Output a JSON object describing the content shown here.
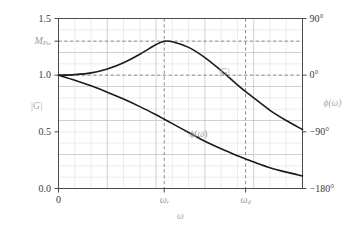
{
  "chart_data": {
    "type": "line",
    "title": "",
    "xlabel": "ω",
    "ylabel_left": "|G|",
    "ylabel_right": "ϕ(ω)",
    "grid": true,
    "legend": "inline-annotations",
    "xlim": [
      0,
      15
    ],
    "ylim_left": [
      0.0,
      1.5
    ],
    "ylim_right": [
      -180,
      90
    ],
    "x_ticks": [
      {
        "value": 0,
        "label": "0"
      },
      {
        "value": 6.5,
        "label": "ωr"
      },
      {
        "value": 11.5,
        "label": "ωd"
      }
    ],
    "y_ticks_left": [
      {
        "value": 1.5,
        "label": "1.5"
      },
      {
        "value": 1.3,
        "label": "MPw"
      },
      {
        "value": 1.0,
        "label": "1.0"
      },
      {
        "value": 0.5,
        "label": "0.5"
      },
      {
        "value": 0.0,
        "label": "0.0"
      }
    ],
    "y_ticks_right": [
      {
        "value": 90,
        "label": "90°"
      },
      {
        "value": 0,
        "label": "0°"
      },
      {
        "value": -90,
        "label": "−90°"
      },
      {
        "value": -180,
        "label": "−180°"
      }
    ],
    "reference_lines": [
      {
        "axis": "y",
        "value": 1.3,
        "style": "dashed",
        "note": "resonant peak magnitude MPw"
      },
      {
        "axis": "y",
        "value": 1.0,
        "style": "dashed",
        "note": "unity gain / 0 degrees"
      },
      {
        "axis": "x",
        "value": 6.5,
        "style": "dashed",
        "note": "resonant frequency wr"
      },
      {
        "axis": "x",
        "value": 11.5,
        "style": "dashed",
        "note": "damped frequency wd"
      }
    ],
    "series": [
      {
        "name": "|G|",
        "label": "|G|",
        "axis": "left",
        "color": "#1a1a1a",
        "x": [
          0,
          1,
          2,
          3,
          4,
          5,
          6,
          6.5,
          7,
          8,
          9,
          10,
          11,
          11.5,
          12,
          13,
          14,
          15
        ],
        "values": [
          1.0,
          1.005,
          1.02,
          1.055,
          1.11,
          1.185,
          1.27,
          1.3,
          1.295,
          1.245,
          1.155,
          1.04,
          0.915,
          0.855,
          0.8,
          0.69,
          0.6,
          0.52
        ]
      },
      {
        "name": "ϕ(ω)",
        "label": "ϕ(ω)",
        "axis": "right",
        "color": "#1a1a1a",
        "x": [
          0,
          1,
          2,
          3,
          4,
          5,
          6,
          6.5,
          7,
          8,
          9,
          10,
          11,
          11.5,
          12,
          13,
          14,
          15
        ],
        "values": [
          0,
          -8,
          -17,
          -27,
          -38,
          -50,
          -63,
          -70,
          -77,
          -91,
          -105,
          -117,
          -128,
          -133,
          -138,
          -147,
          -154,
          -160
        ]
      }
    ],
    "annotations": [
      {
        "text": "|G|",
        "x": 10.2,
        "y_left": 1.02,
        "color": "#a0a0a0"
      },
      {
        "text": "ϕ(ω)",
        "x": 8.6,
        "y_left": 0.47,
        "color": "#a0a0a0"
      }
    ]
  },
  "axis_left": {
    "title": "|G|",
    "t_1_5": "1.5",
    "t_mp": "M",
    "t_mp_sub": "Pω",
    "t_1_0": "1.0",
    "t_0_5": "0.5",
    "t_0_0": "0.0"
  },
  "axis_right": {
    "title_phi": "ϕ",
    "title_paren_open": "(",
    "title_omega": "ω",
    "title_paren_close": ")",
    "t_90": "90°",
    "t_0": "0°",
    "t_m90": "−90°",
    "t_m180": "−180°"
  },
  "axis_bottom": {
    "title": "ω",
    "t_0": "0",
    "t_wr_base": "ω",
    "t_wr_sub": "r",
    "t_wd_base": "ω",
    "t_wd_sub": "d"
  },
  "curve_labels": {
    "mag_base": "|G|",
    "phase_phi": "ϕ",
    "phase_open": "(",
    "phase_omega": "ω",
    "phase_close": ")"
  }
}
